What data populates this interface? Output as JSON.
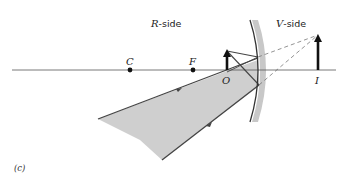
{
  "diagram": {
    "type": "convex-mirror-ray-diagram",
    "labels": {
      "r_side_letter": "R",
      "r_side_suffix": "-side",
      "v_side_letter": "V",
      "v_side_suffix": "-side",
      "center": "C",
      "focal": "F",
      "object": "O",
      "image": "I",
      "caption": "(c)"
    },
    "colors": {
      "axis": "#555555",
      "ray": "#444444",
      "beam_fill": "#cfcfcf",
      "mirror_back": "#c8c8c8",
      "mirror_line": "#333333",
      "arrow": "#111111"
    },
    "points": {
      "C": [
        130,
        70
      ],
      "F": [
        193,
        70
      ],
      "O": [
        227,
        70
      ],
      "I": [
        318,
        70
      ]
    }
  }
}
